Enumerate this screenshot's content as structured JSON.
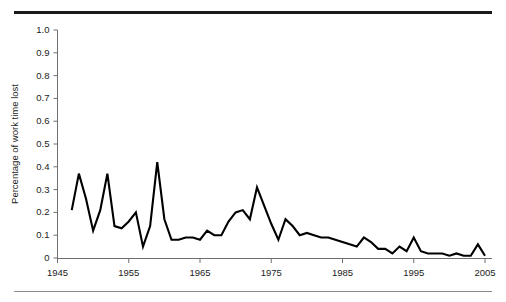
{
  "figure": {
    "top_rule_color": "#1a1a1a",
    "bottom_rule_color": "#8a8a8a",
    "background": "#ffffff",
    "line_color": "#000000",
    "axis_color": "#6f6f6f"
  },
  "chart_data": {
    "type": "line",
    "title": "",
    "subtitle": "",
    "xlabel": "",
    "ylabel": "Percentage of work time lost",
    "xlim": [
      1945,
      2005
    ],
    "ylim": [
      0,
      1.0
    ],
    "grid": false,
    "legend": false,
    "xticks": [
      1945,
      1955,
      1965,
      1975,
      1985,
      1995,
      2005
    ],
    "xtick_labels": [
      "1945",
      "1955",
      "1965",
      "1975",
      "1985",
      "1995",
      "2005"
    ],
    "yticks": [
      0,
      0.1,
      0.2,
      0.3,
      0.4,
      0.5,
      0.6,
      0.7,
      0.8,
      0.9,
      1.0
    ],
    "ytick_labels": [
      "0",
      "0.1",
      "0.2",
      "0.3",
      "0.4",
      "0.5",
      "0.6",
      "0.7",
      "0.8",
      "0.9",
      "1.0"
    ],
    "series": [
      {
        "name": "Percentage of work time lost",
        "color": "#000000",
        "x": [
          1947,
          1948,
          1949,
          1950,
          1951,
          1952,
          1953,
          1954,
          1955,
          1956,
          1957,
          1958,
          1959,
          1960,
          1961,
          1962,
          1963,
          1964,
          1965,
          1966,
          1967,
          1968,
          1969,
          1970,
          1971,
          1972,
          1973,
          1974,
          1975,
          1976,
          1977,
          1978,
          1979,
          1980,
          1981,
          1982,
          1983,
          1984,
          1985,
          1986,
          1987,
          1988,
          1989,
          1990,
          1991,
          1992,
          1993,
          1994,
          1995,
          1996,
          1997,
          1998,
          1999,
          2000,
          2001,
          2002,
          2003,
          2004,
          2005
        ],
        "y": [
          0.21,
          0.37,
          0.26,
          0.12,
          0.21,
          0.37,
          0.14,
          0.13,
          0.16,
          0.2,
          0.05,
          0.14,
          0.42,
          0.17,
          0.08,
          0.08,
          0.09,
          0.09,
          0.08,
          0.12,
          0.1,
          0.1,
          0.16,
          0.2,
          0.21,
          0.17,
          0.31,
          0.23,
          0.15,
          0.08,
          0.17,
          0.14,
          0.1,
          0.11,
          0.1,
          0.09,
          0.09,
          0.08,
          0.07,
          0.06,
          0.05,
          0.09,
          0.07,
          0.04,
          0.04,
          0.02,
          0.05,
          0.03,
          0.09,
          0.03,
          0.02,
          0.02,
          0.02,
          0.01,
          0.02,
          0.01,
          0.01,
          0.06,
          0.01
        ]
      }
    ]
  },
  "axis_titles": {
    "y": "Percentage of work time lost"
  }
}
